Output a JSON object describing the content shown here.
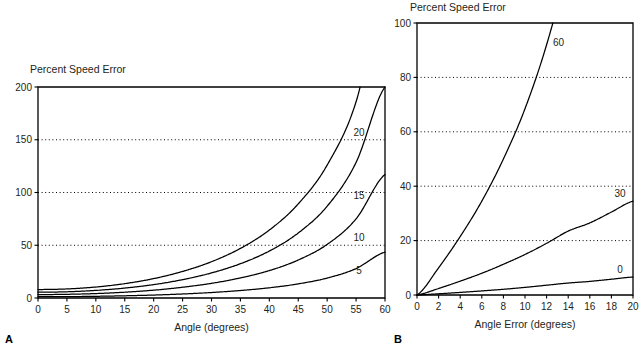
{
  "figure": {
    "panels": [
      {
        "letter": "A",
        "title": "Percent Speed Error",
        "xlabel": "Angle (degrees)",
        "ylabel": ""
      },
      {
        "letter": "B",
        "title": "Percent Speed Error",
        "xlabel": "Angle Error (degrees)",
        "ylabel": ""
      }
    ]
  },
  "chart_data": [
    {
      "type": "line",
      "panel": "A",
      "title": "Percent Speed Error",
      "xlabel": "Angle (degrees)",
      "ylabel": "Percent Speed Error",
      "xlim": [
        0,
        60
      ],
      "ylim": [
        0,
        200
      ],
      "xticks": [
        0,
        5,
        10,
        15,
        20,
        25,
        30,
        35,
        40,
        45,
        50,
        55,
        60
      ],
      "yticks": [
        0,
        50,
        100,
        150,
        200
      ],
      "grid": "horizontal-dotted-at-50-100-150",
      "legend": "inline-curve-end-labels",
      "x": [
        0,
        5,
        10,
        15,
        20,
        25,
        30,
        35,
        40,
        45,
        50,
        55,
        60
      ],
      "series": [
        {
          "name": "20",
          "label": "20",
          "values": [
            8.0,
            8.6,
            10.4,
            13.6,
            18.4,
            25.2,
            34.4,
            47.0,
            64.4,
            89.2,
            126.0,
            186.0,
            300.0
          ],
          "clipped_at": 200,
          "label_x": 55.5,
          "label_y": 157
        },
        {
          "name": "15",
          "label": "15",
          "values": [
            5.5,
            5.9,
            7.2,
            9.4,
            12.7,
            17.4,
            23.8,
            32.5,
            44.5,
            61.6,
            87.0,
            128.5,
            200.0
          ],
          "label_x": 55.5,
          "label_y": 97
        },
        {
          "name": "10",
          "label": "10",
          "values": [
            3.2,
            3.5,
            4.2,
            5.5,
            7.4,
            10.2,
            13.9,
            19.0,
            26.0,
            36.0,
            50.8,
            75.0,
            117.0
          ],
          "label_x": 55.5,
          "label_y": 57
        },
        {
          "name": "5",
          "label": "5",
          "values": [
            1.2,
            1.3,
            1.6,
            2.1,
            2.8,
            3.8,
            5.2,
            7.1,
            9.7,
            13.4,
            18.9,
            27.9,
            43.5
          ],
          "label_x": 55.5,
          "label_y": 26
        }
      ]
    },
    {
      "type": "line",
      "panel": "B",
      "title": "Percent Speed Error",
      "xlabel": "Angle Error (degrees)",
      "ylabel": "Percent Speed Error",
      "xlim": [
        0,
        20
      ],
      "ylim": [
        0,
        100
      ],
      "xticks": [
        0,
        2,
        4,
        6,
        8,
        10,
        12,
        14,
        16,
        18,
        20
      ],
      "yticks": [
        0,
        20,
        40,
        60,
        80,
        100
      ],
      "grid": "horizontal-dotted-at-20-40-60-80",
      "legend": "inline-curve-end-labels",
      "x": [
        0,
        2,
        4,
        6,
        8,
        10,
        12,
        14,
        16,
        18,
        20
      ],
      "series": [
        {
          "name": "60",
          "label": "60",
          "values": [
            0,
            10.0,
            21.5,
            34.5,
            50.0,
            68.5,
            92.0,
            122.0,
            160.0,
            210.0,
            280.0
          ],
          "clipped_at": 100,
          "label_x": 13.1,
          "label_y": 93
        },
        {
          "name": "30",
          "label": "30",
          "values": [
            0,
            2.4,
            5.1,
            8.0,
            11.3,
            14.9,
            19.0,
            23.5,
            26.5,
            30.5,
            34.5
          ],
          "label_x": 18.8,
          "label_y": 37.5
        },
        {
          "name": "0",
          "label": "0",
          "values": [
            0,
            0.45,
            0.95,
            1.5,
            2.1,
            2.8,
            3.6,
            4.4,
            5.0,
            5.8,
            6.6
          ],
          "label_x": 18.8,
          "label_y": 9.5
        }
      ]
    }
  ]
}
